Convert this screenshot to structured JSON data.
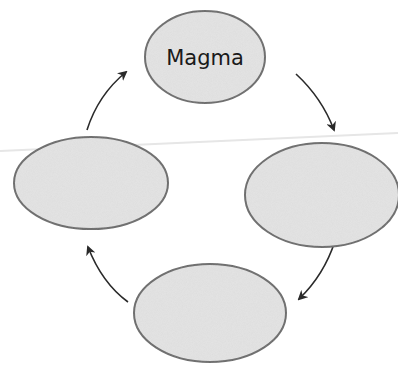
{
  "diagram": {
    "type": "cycle",
    "nodes": [
      {
        "id": "top",
        "label": "Magma",
        "cx": 205,
        "cy": 57,
        "rx": 60,
        "ry": 46
      },
      {
        "id": "right",
        "label": "",
        "cx": 322,
        "cy": 195,
        "rx": 77,
        "ry": 52
      },
      {
        "id": "bottom",
        "label": "",
        "cx": 210,
        "cy": 313,
        "rx": 76,
        "ry": 49
      },
      {
        "id": "left",
        "label": "",
        "cx": 91,
        "cy": 183,
        "rx": 77,
        "ry": 46
      }
    ],
    "edges": [
      {
        "from": "top",
        "to": "right"
      },
      {
        "from": "right",
        "to": "bottom"
      },
      {
        "from": "bottom",
        "to": "left"
      },
      {
        "from": "left",
        "to": "top"
      }
    ],
    "colors": {
      "node_fill": "#e3e3e3",
      "node_stroke": "#6a6a6a",
      "arrow": "#2a2a2a",
      "scan_line": "#e8e8e8"
    }
  }
}
